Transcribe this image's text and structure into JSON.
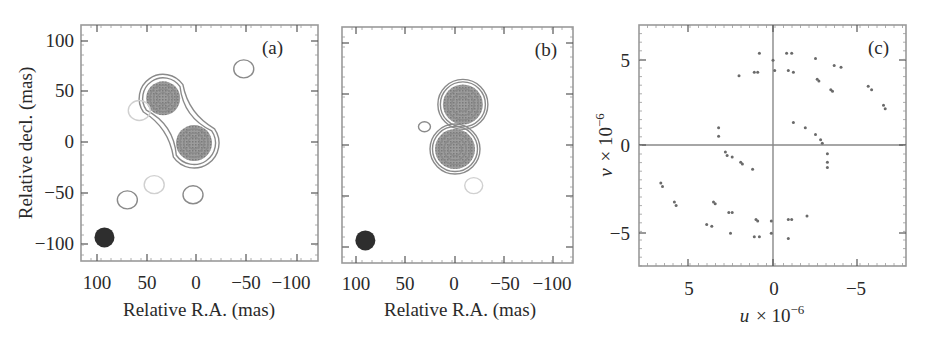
{
  "figure": {
    "panels": [
      {
        "tag": "(a)",
        "xlabel": "Relative R.A. (mas)",
        "ylabel": "Relative decl. (mas)",
        "xticks": [
          "100",
          "50",
          "0",
          "−50",
          "−100"
        ],
        "yticks": [
          "100",
          "50",
          "0",
          "−50",
          "−100"
        ]
      },
      {
        "tag": "(b)",
        "xlabel": "Relative R.A. (mas)",
        "ylabel": "",
        "xticks": [
          "100",
          "50",
          "0",
          "−50",
          "−100"
        ],
        "yticks": []
      },
      {
        "tag": "(c)",
        "xlabel": "u × 10",
        "xlabel_sup": "−6",
        "ylabel": "v × 10",
        "ylabel_sup": "−6",
        "xticks": [
          "5",
          "0",
          "−5"
        ],
        "yticks": [
          "5",
          "0",
          "−5"
        ]
      }
    ]
  },
  "chart_data": [
    {
      "type": "heatmap",
      "title": "(a)",
      "xlabel": "Relative R.A. (mas)",
      "ylabel": "Relative decl. (mas)",
      "xlim": [
        118,
        -118
      ],
      "ylim": [
        -118,
        115
      ],
      "x_ticks": [
        100,
        50,
        0,
        -50,
        -100
      ],
      "y_ticks": [
        100,
        50,
        0,
        -50,
        -100
      ],
      "grid": false,
      "components": [
        {
          "name": "north-east component",
          "ra": 33,
          "dec": 43,
          "radius": 17
        },
        {
          "name": "core component",
          "ra": 2,
          "dec": -1,
          "radius": 18
        }
      ],
      "low_level_contours": [
        {
          "ra": -48,
          "dec": 72,
          "radius": 9
        },
        {
          "ra": 57,
          "dec": 31,
          "radius": 10,
          "faint": true
        },
        {
          "ra": 69,
          "dec": -57,
          "radius": 9
        },
        {
          "ra": 42,
          "dec": -42,
          "radius": 9,
          "faint": true
        },
        {
          "ra": 3,
          "dec": -52,
          "radius": 9
        }
      ],
      "beam": {
        "ra": 92,
        "dec": -94,
        "radius": 10
      }
    },
    {
      "type": "heatmap",
      "title": "(b)",
      "xlabel": "Relative R.A. (mas)",
      "xlim": [
        118,
        -118
      ],
      "ylim": [
        -118,
        115
      ],
      "x_ticks": [
        100,
        50,
        0,
        -50,
        -100
      ],
      "grid": false,
      "components": [
        {
          "name": "north component",
          "ra": -8,
          "dec": 40,
          "radius": 20
        },
        {
          "name": "south component",
          "ra": 0,
          "dec": -4,
          "radius": 20
        }
      ],
      "low_level_contours": [
        {
          "ra": 31,
          "dec": 18,
          "radius": 5
        },
        {
          "ra": -19,
          "dec": -40,
          "radius": 8,
          "faint": true
        }
      ],
      "beam": {
        "ra": 91,
        "dec": -94,
        "radius": 10
      }
    },
    {
      "type": "scatter",
      "title": "(c)",
      "xlabel": "u × 10^-6",
      "ylabel": "v × 10^-6",
      "xlim": [
        8,
        -8
      ],
      "ylim": [
        -7,
        7
      ],
      "x_ticks": [
        5,
        0,
        -5
      ],
      "y_ticks": [
        5,
        0,
        -5
      ],
      "zero_lines": true,
      "points": [
        [
          -0.8,
          5.3
        ],
        [
          -1.1,
          5.3
        ],
        [
          -0.9,
          4.3
        ],
        [
          -1.2,
          4.2
        ],
        [
          -2.5,
          5.0
        ],
        [
          -2.6,
          3.8
        ],
        [
          -2.7,
          3.7
        ],
        [
          -3.6,
          4.6
        ],
        [
          -4.0,
          4.5
        ],
        [
          -3.4,
          3.2
        ],
        [
          -3.5,
          3.1
        ],
        [
          -5.6,
          3.4
        ],
        [
          -5.8,
          3.2
        ],
        [
          -6.5,
          2.3
        ],
        [
          -6.6,
          2.1
        ],
        [
          -1.2,
          1.3
        ],
        [
          -1.9,
          1.0
        ],
        [
          -2.5,
          0.6
        ],
        [
          -2.8,
          0.3
        ],
        [
          -2.9,
          0.1
        ],
        [
          -3.2,
          -0.5
        ],
        [
          -3.2,
          -1.0
        ],
        [
          -3.2,
          -1.3
        ],
        [
          0.8,
          5.3
        ],
        [
          1.1,
          4.2
        ],
        [
          0.9,
          4.2
        ],
        [
          2.0,
          4.0
        ],
        [
          0.0,
          4.9
        ],
        [
          -0.1,
          4.3
        ],
        [
          3.2,
          1.0
        ],
        [
          3.2,
          0.5
        ],
        [
          2.8,
          -0.4
        ],
        [
          2.7,
          -0.6
        ],
        [
          2.4,
          -0.7
        ],
        [
          1.9,
          -1.0
        ],
        [
          1.8,
          -1.1
        ],
        [
          1.2,
          -1.4
        ],
        [
          6.6,
          -2.2
        ],
        [
          6.5,
          -2.4
        ],
        [
          5.8,
          -3.3
        ],
        [
          5.7,
          -3.5
        ],
        [
          3.5,
          -3.3
        ],
        [
          3.4,
          -3.4
        ],
        [
          2.6,
          -3.9
        ],
        [
          2.4,
          -3.9
        ],
        [
          3.9,
          -4.6
        ],
        [
          3.6,
          -4.7
        ],
        [
          2.5,
          -5.1
        ],
        [
          1.0,
          -4.3
        ],
        [
          0.9,
          -4.4
        ],
        [
          1.1,
          -5.3
        ],
        [
          0.8,
          -5.3
        ],
        [
          0.1,
          -4.4
        ],
        [
          0.1,
          -5.1
        ],
        [
          -0.9,
          -4.3
        ],
        [
          -1.1,
          -4.3
        ],
        [
          -2.0,
          -4.1
        ],
        [
          -0.9,
          -5.4
        ]
      ]
    }
  ]
}
